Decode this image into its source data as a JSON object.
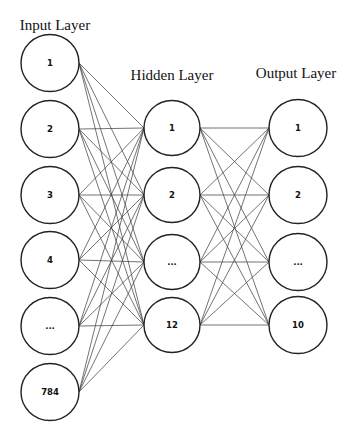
{
  "diagram": {
    "type": "neural-network",
    "layers": [
      {
        "title": "Input Layer",
        "title_x": 55,
        "title_y": 30,
        "cx": 50,
        "r": 29,
        "nodes": [
          {
            "label": "1",
            "cy": 63
          },
          {
            "label": "2",
            "cy": 129
          },
          {
            "label": "3",
            "cy": 195
          },
          {
            "label": "4",
            "cy": 260
          },
          {
            "label": "...",
            "cy": 326
          },
          {
            "label": "784",
            "cy": 392
          }
        ]
      },
      {
        "title": "Hidden Layer",
        "title_x": 172,
        "title_y": 80,
        "cx": 172,
        "r": 28,
        "nodes": [
          {
            "label": "1",
            "cy": 128
          },
          {
            "label": "2",
            "cy": 195
          },
          {
            "label": "...",
            "cy": 262
          },
          {
            "label": "12",
            "cy": 325
          }
        ]
      },
      {
        "title": "Output Layer",
        "title_x": 296,
        "title_y": 78,
        "cx": 298,
        "r": 29,
        "nodes": [
          {
            "label": "1",
            "cy": 128
          },
          {
            "label": "2",
            "cy": 195
          },
          {
            "label": "...",
            "cy": 262
          },
          {
            "label": "10",
            "cy": 325
          }
        ]
      }
    ],
    "connections": "fully-connected between adjacent layers",
    "colors": {
      "node_stroke": "#222222",
      "edge": "#444444",
      "background": "#ffffff",
      "text": "#111111"
    }
  }
}
